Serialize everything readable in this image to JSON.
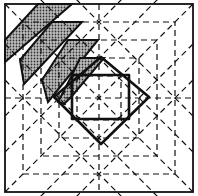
{
  "diagram": {
    "kind": "origami-crease-pattern",
    "width": 198,
    "height": 196,
    "colors": {
      "background": "#ffffff",
      "line": "#111111",
      "shade_bg": "#bdbdbd",
      "shade_dot": "#333333"
    },
    "outer_square": {
      "x1": 5,
      "y1": 4,
      "x2": 193,
      "y2": 192
    },
    "center": {
      "x": 99,
      "y": 98
    },
    "dashed_squares_half_widths": [
      22,
      40,
      58,
      76
    ],
    "bold_diamond": [
      [
        101,
        57
      ],
      [
        149,
        97
      ],
      [
        101,
        144
      ],
      [
        54,
        97
      ]
    ],
    "bold_square": {
      "x1": 72,
      "y1": 75,
      "x2": 129,
      "y2": 119
    },
    "shaded_strips": [
      [
        [
          5,
          40
        ],
        [
          38,
          4
        ],
        [
          72,
          4
        ],
        [
          5,
          62
        ]
      ],
      [
        [
          20,
          60
        ],
        [
          52,
          22
        ],
        [
          82,
          22
        ],
        [
          24,
          84
        ]
      ],
      [
        [
          42,
          80
        ],
        [
          68,
          40
        ],
        [
          98,
          40
        ],
        [
          48,
          102
        ]
      ],
      [
        [
          58,
          102
        ],
        [
          72,
          75
        ],
        [
          80,
          58
        ],
        [
          104,
          58
        ],
        [
          72,
          96
        ],
        [
          64,
          104
        ]
      ]
    ],
    "labels": []
  }
}
